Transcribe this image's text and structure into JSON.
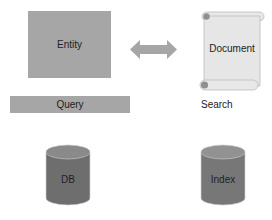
{
  "diagram": {
    "nodes": {
      "entity": {
        "label": "Entity",
        "shape": "rectangle",
        "color": "#a6a6a6"
      },
      "query": {
        "label": "Query",
        "shape": "rectangle",
        "color": "#a6a6a6"
      },
      "document": {
        "label": "Document",
        "shape": "scroll",
        "color": "#e6e6e6"
      },
      "db": {
        "label": "DB",
        "shape": "cylinder",
        "color": "#6e6e6e"
      },
      "index": {
        "label": "Index",
        "shape": "cylinder",
        "color": "#777777"
      }
    },
    "labels": {
      "search": "Search"
    },
    "edges": [
      {
        "from": "entity",
        "to": "document",
        "type": "bidirectional-arrow",
        "color": "#a6a6a6"
      }
    ]
  }
}
